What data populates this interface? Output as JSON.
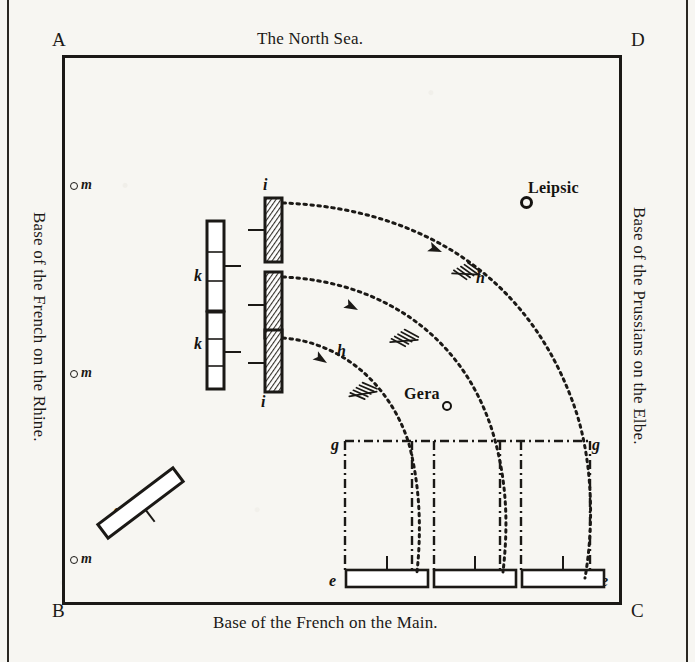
{
  "figure": {
    "type": "military-campaign-diagram",
    "frame_corners": [
      {
        "id": "A",
        "label": "A",
        "position": "top-left"
      },
      {
        "id": "D",
        "label": "D",
        "position": "top-right"
      },
      {
        "id": "B",
        "label": "B",
        "position": "bottom-left"
      },
      {
        "id": "C",
        "label": "C",
        "position": "bottom-right"
      }
    ],
    "edges": {
      "top": "The North Sea.",
      "bottom": "Base of the French on the Main.",
      "left": "Base of the French on the Rhine.",
      "right": "Base of the Prussians on the Elbe."
    }
  },
  "cities": [
    {
      "name": "Leipsic"
    },
    {
      "name": "Gera"
    }
  ],
  "markers": {
    "m_label": "m",
    "m_positions": [
      "upper",
      "middle",
      "lower"
    ]
  },
  "units": {
    "k_label": "k",
    "i_label": "i",
    "h_label": "h",
    "g_label": "g",
    "e_label": "e",
    "f_label": "f",
    "k_count": 2,
    "i_count": 3,
    "e_count": 3,
    "h_count": 2,
    "g_count": 2,
    "e_ends_count": 2
  },
  "colors": {
    "ink": "#1b1916",
    "paper": "#f7f6f2",
    "hatch": "#33302a"
  }
}
